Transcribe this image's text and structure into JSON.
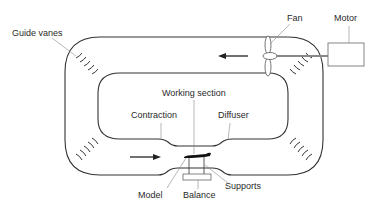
{
  "diagram": {
    "labels": {
      "guide_vanes": "Guide vanes",
      "fan": "Fan",
      "motor": "Motor",
      "working_section": "Working section",
      "contraction": "Contraction",
      "diffuser": "Diffuser",
      "model": "Model",
      "balance": "Balance",
      "supports": "Supports"
    },
    "flow_arrows": [
      "left (top duct)",
      "right (bottom duct, into working section)"
    ],
    "colors": {
      "line": "#333333",
      "leader": "#888888",
      "background": "#ffffff"
    }
  }
}
